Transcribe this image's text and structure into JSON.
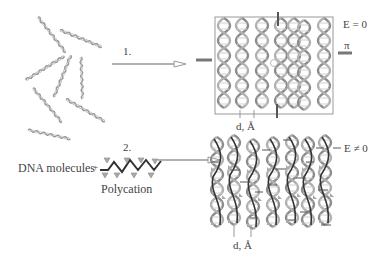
{
  "diagram": {
    "step1": {
      "label": "1."
    },
    "step2": {
      "label": "2."
    },
    "left_label": "DNA molecules",
    "plus": "+",
    "polycation_label": "Polycation",
    "box1": {
      "energy_label": "E = 0",
      "pressure_label": "π",
      "spacing_label": "d, Å"
    },
    "box2": {
      "energy_label": "E ≠ 0",
      "spacing_label": "d, Å"
    }
  },
  "colors": {
    "stroke": "#8a8a8a",
    "dark": "#444444",
    "helix": "#9a9a9a",
    "box": "#999999"
  }
}
